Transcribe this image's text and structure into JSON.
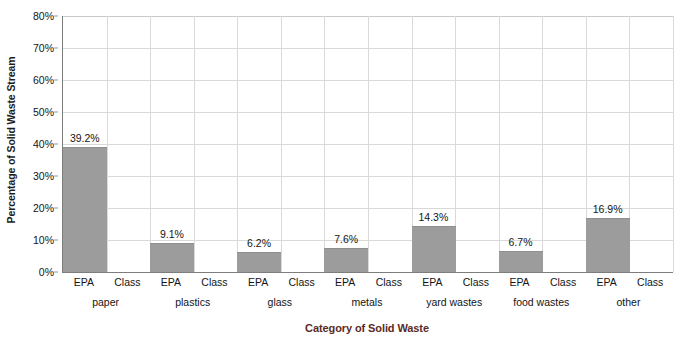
{
  "chart_data": {
    "type": "bar",
    "title": "",
    "xlabel": "Category of Solid Waste",
    "ylabel": "Percentage of Solid Waste Stream",
    "ylim": [
      0,
      80
    ],
    "ytick_labels": [
      "0%",
      "10%",
      "20%",
      "30%",
      "40%",
      "50%",
      "60%",
      "70%",
      "80%"
    ],
    "ytick_values": [
      0,
      10,
      20,
      30,
      40,
      50,
      60,
      70,
      80
    ],
    "grid": true,
    "legend": "none",
    "categories": [
      "paper",
      "plastics",
      "glass",
      "metals",
      "yard wastes",
      "food wastes",
      "other"
    ],
    "subcategories": [
      "EPA",
      "Class"
    ],
    "series": [
      {
        "name": "EPA",
        "values": [
          39.2,
          9.1,
          6.2,
          7.6,
          14.3,
          6.7,
          16.9
        ],
        "color": "#9c9c9c"
      },
      {
        "name": "Class",
        "values": [
          null,
          null,
          null,
          null,
          null,
          null,
          null
        ],
        "color": "#9c9c9c"
      }
    ],
    "bar_labels": [
      "39.2%",
      "9.1%",
      "6.2%",
      "7.6%",
      "14.3%",
      "6.7%",
      "16.9%"
    ],
    "slot_labels": [
      "EPA",
      "Class",
      "EPA",
      "Class",
      "EPA",
      "Class",
      "EPA",
      "Class",
      "EPA",
      "Class",
      "EPA",
      "Class",
      "EPA",
      "Class"
    ]
  },
  "colors": {
    "bar_fill": "#9c9c9c",
    "gridline": "#d9d9d9",
    "axis_line": "#7d7d7d",
    "xlabel_color": "#5b2a24",
    "text": "#141414",
    "background": "#ffffff"
  }
}
